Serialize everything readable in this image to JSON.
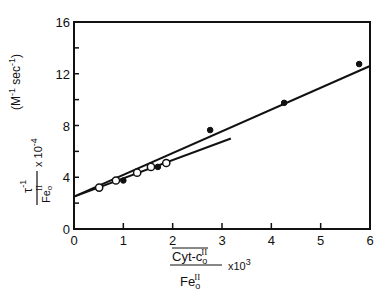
{
  "chart_data": {
    "type": "scatter",
    "title": "",
    "xlabel": "(Cyt-c_o^II / Fe_o^II) x 10^3",
    "ylabel": "(tau^-1 / Fe_o^II) x 10^-4 (M^-1 sec^-1)",
    "xlim": [
      0,
      6
    ],
    "ylim": [
      0,
      16
    ],
    "x_ticks": [
      0,
      1,
      2,
      3,
      4,
      5,
      6
    ],
    "y_ticks": [
      0,
      4,
      8,
      12,
      16
    ],
    "y_minor_ticks": [
      2,
      6,
      10,
      14
    ],
    "grid": false,
    "legend": null,
    "series": [
      {
        "name": "open circles",
        "marker": "open-circle",
        "x": [
          0.51,
          0.85,
          1.28,
          1.56,
          1.87
        ],
        "y": [
          3.2,
          3.75,
          4.35,
          4.8,
          5.1
        ]
      },
      {
        "name": "filled circles",
        "marker": "filled-circle",
        "x": [
          1.0,
          1.7,
          2.76,
          4.26,
          5.78
        ],
        "y": [
          3.75,
          4.8,
          7.65,
          9.75,
          12.75
        ]
      }
    ],
    "lines": [
      {
        "name": "fit line (full range)",
        "x": [
          0,
          6
        ],
        "y": [
          2.5,
          12.6
        ]
      },
      {
        "name": "fit line (open circles)",
        "x": [
          0,
          3.18
        ],
        "y": [
          2.5,
          7.0
        ]
      }
    ]
  },
  "labels": {
    "x_tick_labels": [
      "0",
      "1",
      "2",
      "3",
      "4",
      "5",
      "6"
    ],
    "y_tick_labels": [
      "0",
      "4",
      "8",
      "12",
      "16"
    ],
    "x_axis_numerator": "Cyt-c",
    "x_axis_numerator_sub": "o",
    "x_axis_numerator_sup": "II",
    "x_axis_denominator": "Fe",
    "x_axis_denominator_sub": "o",
    "x_axis_denominator_sup": "II",
    "x_axis_multiplier": "x10",
    "x_axis_multiplier_exp": "3",
    "y_axis_numerator": "τ",
    "y_axis_numerator_sup": "-1",
    "y_axis_denominator": "Fe",
    "y_axis_denominator_sub": "o",
    "y_axis_denominator_sup": "II",
    "y_axis_multiplier": "x 10",
    "y_axis_multiplier_exp": "-4",
    "y_axis_units": "(M",
    "y_axis_units_exp1": "-1",
    "y_axis_units_mid": " sec",
    "y_axis_units_exp2": "-1",
    "y_axis_units_close": ")"
  }
}
